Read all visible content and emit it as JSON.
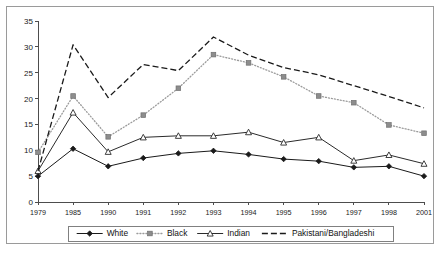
{
  "chart_data": {
    "type": "line",
    "title": "",
    "subtitle": "",
    "xlabel": "",
    "ylabel": "",
    "x": [
      "1979",
      "1985",
      "1990",
      "1991",
      "1992",
      "1993",
      "1994",
      "1995",
      "1996",
      "1997",
      "1998",
      "2001"
    ],
    "categories": [
      "1979",
      "1985",
      "1990",
      "1991",
      "1992",
      "1993",
      "1994",
      "1995",
      "1996",
      "1997",
      "1998",
      "2001"
    ],
    "xlim": [
      0,
      11
    ],
    "ylim": [
      0,
      35
    ],
    "ytick_labels": [
      "0",
      "5",
      "10",
      "15",
      "20",
      "25",
      "30",
      "35"
    ],
    "ytick_values": [
      0,
      5,
      10,
      15,
      20,
      25,
      30,
      35
    ],
    "grid": false,
    "legend_position": "bottom",
    "series": [
      {
        "name": "White",
        "values": [
          5.0,
          10.3,
          6.9,
          8.5,
          9.4,
          9.9,
          9.2,
          8.3,
          7.9,
          6.7,
          6.9,
          5.0
        ],
        "line_style": "solid",
        "marker": "diamond",
        "color": "#1a1a1a"
      },
      {
        "name": "Black",
        "values": [
          9.6,
          20.5,
          12.6,
          16.8,
          22.0,
          28.5,
          26.9,
          24.2,
          20.5,
          19.2,
          14.9,
          13.3
        ],
        "line_style": "dotted",
        "marker": "square",
        "color": "#9b9b9b"
      },
      {
        "name": "Indian",
        "values": [
          6.0,
          17.3,
          9.7,
          12.5,
          12.8,
          12.8,
          13.5,
          11.5,
          12.5,
          8.0,
          9.1,
          7.4
        ],
        "line_style": "solid",
        "marker": "triangle",
        "color": "#2b2b2b"
      },
      {
        "name": "Pakistani/Bangladeshi",
        "values": [
          6.0,
          30.4,
          20.2,
          26.6,
          25.4,
          31.9,
          28.4,
          26.0,
          24.6,
          22.5,
          20.4,
          18.2
        ],
        "line_style": "dashed",
        "marker": "none",
        "color": "#1a1a1a"
      }
    ]
  },
  "legend": {
    "items": [
      {
        "label": "White"
      },
      {
        "label": "Black"
      },
      {
        "label": "Indian"
      },
      {
        "label": "Pakistani/Bangladeshi"
      }
    ]
  },
  "colors": {
    "frame": "#9a9a9a",
    "axis": "#4d4d4d",
    "text": "#1a1a1a",
    "background": "#ffffff",
    "black_series": "#9b9b9b"
  }
}
